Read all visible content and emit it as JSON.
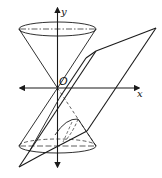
{
  "figure": {
    "labels": {
      "y_axis": "y",
      "x_axis": "x",
      "origin": "O"
    },
    "colors": {
      "stroke": "#1a1a1a",
      "background": "#ffffff"
    },
    "elements": [
      "upper-nappe-cone",
      "lower-nappe-cone",
      "cutting-plane",
      "x-axis",
      "y-axis",
      "intersection-curve"
    ]
  }
}
